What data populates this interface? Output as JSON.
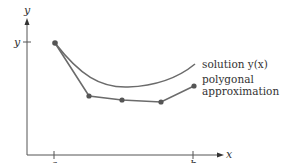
{
  "diagram": {
    "colors": {
      "axis": "#555555",
      "curve": "#6b6b6b",
      "polygon": "#6b6b6b",
      "points": "#555555",
      "text": "#333333"
    },
    "axes": {
      "x_label": "x",
      "y_label": "y",
      "y_tick_label": "y",
      "x_tick_a": "a",
      "x_tick_b": "b"
    },
    "labels": {
      "solution": "solution y(x)",
      "polygonal_line1": "polygonal",
      "polygonal_line2": "approximation"
    },
    "polygon_points": [
      [
        55,
        43
      ],
      [
        89,
        96
      ],
      [
        122,
        100
      ],
      [
        161,
        102
      ],
      [
        194,
        86
      ]
    ],
    "solution_curve": {
      "start": [
        55,
        43
      ],
      "control": [
        120,
        110
      ],
      "end": [
        195,
        64
      ]
    }
  }
}
